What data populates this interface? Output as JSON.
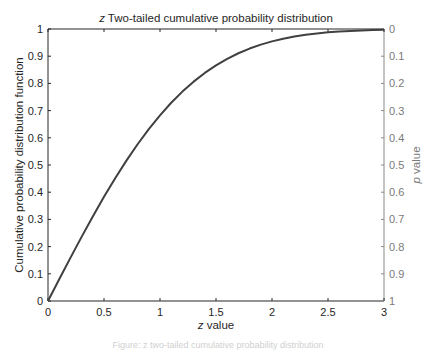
{
  "chart_data": {
    "type": "line",
    "title": "z Two-tailed cumulative probability distribution",
    "title_italic_prefix": "z",
    "title_rest": " Two-tailed cumulative probability distribution",
    "xlabel": "z value",
    "xlabel_italic_prefix": "z",
    "xlabel_rest": " value",
    "ylabel": "Cumulative probability distribution function",
    "ylabel_right": "p value",
    "ylabel_right_italic_prefix": "p",
    "ylabel_right_rest": " value",
    "xlim": [
      0,
      3
    ],
    "ylim": [
      0,
      1
    ],
    "ylim_right": [
      1,
      0
    ],
    "x_ticks": [
      "0",
      "0.5",
      "1",
      "1.5",
      "2",
      "2.5",
      "3"
    ],
    "y_ticks": [
      "0",
      "0.1",
      "0.2",
      "0.3",
      "0.4",
      "0.5",
      "0.6",
      "0.7",
      "0.8",
      "0.9",
      "1"
    ],
    "y_ticks_right": [
      "1",
      "0.9",
      "0.8",
      "0.7",
      "0.6",
      "0.5",
      "0.4",
      "0.3",
      "0.2",
      "0.1",
      "0"
    ],
    "grid": false,
    "legend": null,
    "series": [
      {
        "name": "Two-tailed CDF",
        "color": "#404040",
        "x": [
          0,
          0.1,
          0.2,
          0.3,
          0.4,
          0.5,
          0.6,
          0.7,
          0.8,
          0.9,
          1.0,
          1.1,
          1.2,
          1.3,
          1.4,
          1.5,
          1.6,
          1.7,
          1.8,
          1.9,
          2.0,
          2.1,
          2.2,
          2.3,
          2.4,
          2.5,
          2.6,
          2.7,
          2.8,
          2.9,
          3.0
        ],
        "values": [
          0,
          0.0797,
          0.1585,
          0.2358,
          0.3108,
          0.3829,
          0.4515,
          0.5161,
          0.5763,
          0.6319,
          0.6827,
          0.7287,
          0.7699,
          0.8064,
          0.8385,
          0.8664,
          0.8904,
          0.9109,
          0.9281,
          0.9426,
          0.9545,
          0.9643,
          0.9722,
          0.9786,
          0.9836,
          0.9876,
          0.9907,
          0.9931,
          0.9949,
          0.9963,
          0.9973
        ]
      }
    ]
  },
  "caption": "Figure: z two-tailed cumulative probability distribution"
}
